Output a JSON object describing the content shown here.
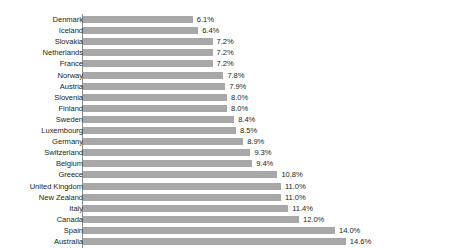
{
  "top_clip_artifact": "",
  "chart_data": {
    "type": "bar",
    "orientation": "horizontal",
    "title": "",
    "subtitle": "",
    "xlabel": "",
    "ylabel": "",
    "grid": false,
    "legend": null,
    "bar_color": "#a8a8a8",
    "label_color": "#231f20",
    "axis_color": "#8c8c8c",
    "value_suffix": "%",
    "xlim": [
      0,
      14.6
    ],
    "sorted": "ascending",
    "categories": [
      "Denmark",
      "Iceland",
      "Slovakia",
      "Netherlands",
      "France",
      "Norway",
      "Austria",
      "Slovenia",
      "Finland",
      "Sweden",
      "Luxembourg",
      "Germany",
      "Switzerland",
      "Belgium",
      "Greece",
      "United Kingdom",
      "New Zealand",
      "Italy",
      "Canada",
      "Spain",
      "Australia"
    ],
    "values": [
      6.1,
      6.4,
      7.2,
      7.2,
      7.2,
      7.8,
      7.9,
      8.0,
      8.0,
      8.4,
      8.5,
      8.9,
      9.3,
      9.4,
      10.8,
      11.0,
      11.0,
      11.4,
      12.0,
      14.0,
      14.6
    ],
    "value_labels": [
      "6.1%",
      "6.4%",
      "7.2%",
      "7.2%",
      "7.2%",
      "7.8%",
      "7.9%",
      "8.0%",
      "8.0%",
      "8.4%",
      "8.5%",
      "8.9%",
      "9.3%",
      "9.4%",
      "10.8%",
      "11.0%",
      "11.0%",
      "11.4%",
      "12.0%",
      "14.0%",
      "14.6%"
    ]
  }
}
